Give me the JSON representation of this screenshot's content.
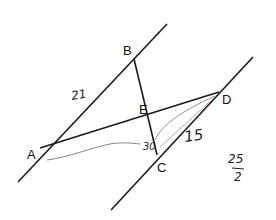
{
  "diagram": {
    "type": "geometry",
    "points": {
      "A": {
        "label": "A",
        "x": 40,
        "y": 148
      },
      "B": {
        "label": "B",
        "x": 134,
        "y": 59
      },
      "C": {
        "label": "C",
        "x": 157,
        "y": 155
      },
      "D": {
        "label": "D",
        "x": 219,
        "y": 92
      },
      "E": {
        "label": "E",
        "x": 150,
        "y": 118
      }
    },
    "segments": [
      {
        "name": "upper-parallel-line",
        "from": [
          18,
          182
        ],
        "to": [
          167,
          24
        ]
      },
      {
        "name": "lower-parallel-line",
        "from": [
          111,
          210
        ],
        "to": [
          253,
          57
        ]
      },
      {
        "name": "segment-BC",
        "from": "B",
        "to": "C"
      },
      {
        "name": "segment-AD",
        "from": "A",
        "to": "D"
      }
    ],
    "annotations": {
      "ab_length": "21",
      "cd_length": "15",
      "ae_length": "30",
      "fraction_numerator": "25",
      "fraction_denominator": "2"
    },
    "colors": {
      "line": "#1a1a1a",
      "pencil": "#777777",
      "background": "#ffffff"
    }
  }
}
